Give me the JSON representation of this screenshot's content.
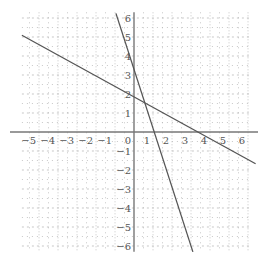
{
  "chart_data": {
    "type": "line",
    "title": "",
    "xlabel": "",
    "ylabel": "",
    "xlim": [
      -5.9,
      6.4
    ],
    "ylim": [
      -6.3,
      6.3
    ],
    "grid": true,
    "x_ticks": [
      -5,
      -4,
      -3,
      -2,
      -1,
      0,
      1,
      2,
      3,
      4,
      5,
      6
    ],
    "y_ticks": [
      -6,
      -5,
      -4,
      -3,
      -2,
      -1,
      1,
      2,
      3,
      4,
      5,
      6
    ],
    "series": [
      {
        "name": "line-shallow",
        "slope": -0.55,
        "intercept": 1.85,
        "x": [
          -5.9,
          6.4
        ],
        "color": "#555555"
      },
      {
        "name": "line-steep",
        "slope": -3.1,
        "intercept": 3.3,
        "x": [
          -0.95,
          3.1
        ],
        "color": "#555555"
      }
    ],
    "colors": {
      "axis": "#777777",
      "grid": "#b0b0b0",
      "line": "#555555"
    }
  }
}
